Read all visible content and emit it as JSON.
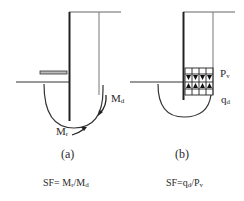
{
  "diagram": {
    "panel_a": {
      "caption": "(a)",
      "label_md": "M",
      "label_md_sub": "d",
      "label_mr": "M",
      "label_mr_sub": "r",
      "equation_prefix": "SF= M",
      "equation_sub1": "r",
      "equation_mid": "/M",
      "equation_sub2": "d"
    },
    "panel_b": {
      "caption": "(b)",
      "label_pv": "P",
      "label_pv_sub": "v",
      "label_qd": "q",
      "label_qd_sub": "d",
      "equation_prefix": "SF=q",
      "equation_sub1": "d",
      "equation_mid": "/P",
      "equation_sub2": "v"
    },
    "colors": {
      "line": "#2a2a2a",
      "thin_line": "#666666"
    }
  }
}
